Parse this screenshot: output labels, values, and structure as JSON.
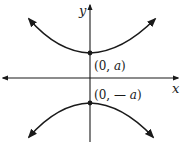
{
  "diagram": {
    "type": "hyperbola",
    "axes": {
      "x_label": "x",
      "y_label": "y"
    },
    "vertices": [
      {
        "name": "upper-vertex",
        "label": "(0, a)",
        "coords": [
          "0",
          "a"
        ]
      },
      {
        "name": "lower-vertex",
        "label": "(0, — a)",
        "coords": [
          "0",
          "-a"
        ]
      }
    ],
    "branches": [
      "upper",
      "lower"
    ],
    "colors": {
      "stroke": "#1a1a1a",
      "background": "#ffffff"
    }
  }
}
